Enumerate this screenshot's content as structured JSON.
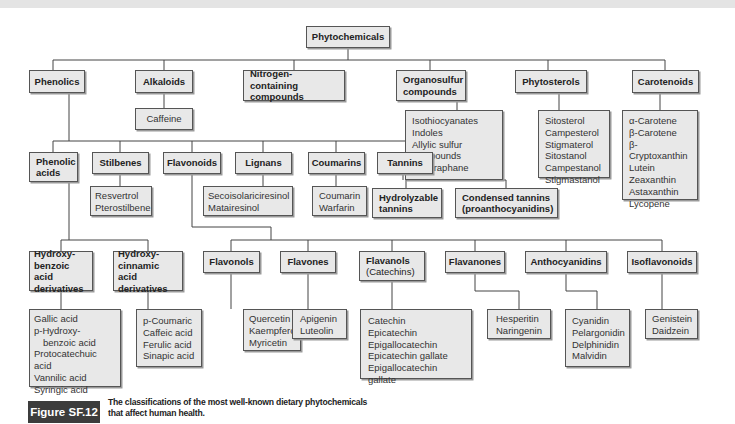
{
  "diagram": {
    "root": "Phytochemicals",
    "level1": {
      "phenolics": "Phenolics",
      "alkaloids": "Alkaloids",
      "nitrogen": [
        "Nitrogen-containing",
        "compounds"
      ],
      "organosulfur": [
        "Organosulfur",
        "compounds"
      ],
      "phytosterols": "Phytosterols",
      "carotenoids": "Carotenoids"
    },
    "alkaloid_examples": [
      "Caffeine"
    ],
    "organosulfur_examples": [
      "Isothiocyanates",
      "Indoles",
      "Allylic sulfur",
      "compounds",
      "Sulforaphane"
    ],
    "phytosterol_examples": [
      "Sitosterol",
      "Campesterol",
      "Stigmaterol",
      "Sitostanol",
      "Campestanol",
      "Stigmastanol"
    ],
    "carotenoid_examples": [
      "α-Carotene",
      "β-Carotene",
      "β-Cryptoxanthin",
      "Lutein",
      "Zeaxanthin",
      "Astaxanthin",
      "Lycopene"
    ],
    "phenolic_classes": {
      "phenolic_acids": [
        "Phenolic",
        "acids"
      ],
      "stilbenes": "Stilbenes",
      "flavonoids": "Flavonoids",
      "lignans": "Lignans",
      "coumarins": "Coumarins",
      "tannins": "Tannins"
    },
    "stilbene_examples": [
      "Resvertrol",
      "Pterostilbene"
    ],
    "lignan_examples": [
      "Secoisolariciresinol",
      "Matairesinol"
    ],
    "coumarin_examples": [
      "Coumarin",
      "Warfarin"
    ],
    "tannin_types": {
      "hydrolyzable": [
        "Hydrolyzable",
        "tannins"
      ],
      "condensed": [
        "Condensed tannins",
        "(proanthocyanidins)"
      ]
    },
    "phenolic_acid_types": {
      "hydroxybenzoic": [
        "Hydroxy-",
        "benzoic acid",
        "derivatives"
      ],
      "hydroxycinnamic": [
        "Hydroxy-",
        "cinnamic acid",
        "derivatives"
      ]
    },
    "hydroxybenzoic_examples": [
      "Gallic acid",
      "p-Hydroxy-",
      "benzoic acid",
      "Protocatechuic acid",
      "Vannilic acid",
      "Syringic acid"
    ],
    "hydroxycinnamic_examples": [
      "p-Coumaric",
      "Caffeic acid",
      "Ferulic acid",
      "Sinapic acid"
    ],
    "flavonoid_subclasses": {
      "flavonols": "Flavonols",
      "flavones": "Flavones",
      "flavanols": [
        "Flavanols",
        "(Catechins)"
      ],
      "flavanones": "Flavanones",
      "anthocyanidins": "Anthocyanidins",
      "isoflavonoids": "Isoflavonoids"
    },
    "flavonol_examples": [
      "Quercetin",
      "Kaempferol",
      "Myricetin"
    ],
    "flavone_examples": [
      "Apigenin",
      "Luteolin"
    ],
    "flavanol_examples": [
      "Catechin",
      "Epicatechin",
      "Epigallocatechin",
      "Epicatechin gallate",
      "Epigallocatechin gallate"
    ],
    "flavanone_examples": [
      "Hesperitin",
      "Naringenin"
    ],
    "anthocyanidin_examples": [
      "Cyanidin",
      "Pelargonidin",
      "Delphinidin",
      "Malvidin"
    ],
    "isoflavonoid_examples": [
      "Genistein",
      "Daidzein"
    ]
  },
  "figure": {
    "label": "Figure SF.12",
    "caption": "The classifications of the most well-known dietary phytochemicals that affect human health."
  },
  "colors": {
    "box_fill": "#e8e8e8",
    "box_border": "#555555",
    "line": "#444444",
    "figure_label_bg": "#3c3c3c"
  }
}
